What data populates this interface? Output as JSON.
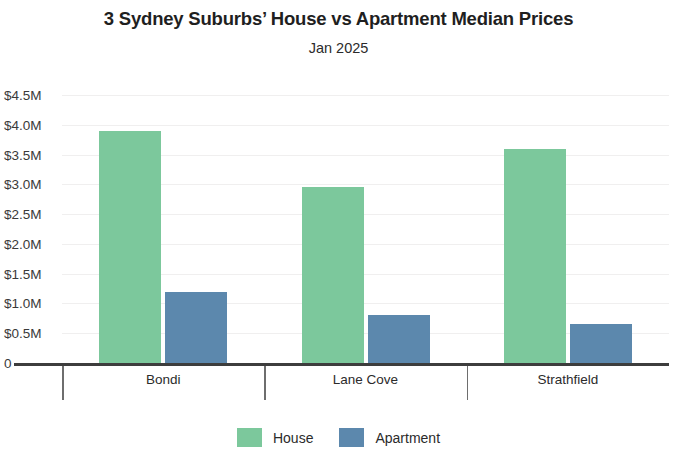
{
  "chart_data": {
    "type": "bar",
    "title": "3 Sydney Suburbs’ House vs Apartment Median Prices",
    "subtitle": "Jan 2025",
    "xlabel": "",
    "ylabel": "",
    "categories": [
      "Bondi",
      "Lane Cove",
      "Strathfield"
    ],
    "series": [
      {
        "name": "House",
        "color": "#7cc89c",
        "values": [
          3.9,
          2.95,
          3.6
        ]
      },
      {
        "name": "Apartment",
        "color": "#5c88ad",
        "values": [
          1.2,
          0.8,
          0.65
        ]
      }
    ],
    "value_unit": "millions of AUD",
    "ylim": [
      0,
      4.5
    ],
    "y_ticks": [
      4.5,
      4.0,
      3.5,
      3.0,
      2.5,
      2.0,
      1.5,
      1.0,
      0.5,
      0
    ],
    "y_tick_labels": [
      "$4.5M",
      "$4.0M",
      "$3.5M",
      "$3.0M",
      "$2.5M",
      "$2.0M",
      "$1.5M",
      "$1.0M",
      "$0.5M",
      "0"
    ],
    "grid": true,
    "legend_position": "bottom"
  }
}
